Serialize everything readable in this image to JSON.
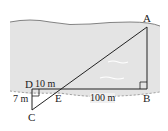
{
  "diagram": {
    "points": {
      "A": "A",
      "B": "B",
      "C": "C",
      "D": "D",
      "E": "E"
    },
    "measurements": {
      "DE": "10 m",
      "EB": "100 m",
      "DC": "7 m"
    },
    "colors": {
      "river": "#e6e6e6",
      "lines": "#222222",
      "bank": "#ffffff"
    }
  }
}
